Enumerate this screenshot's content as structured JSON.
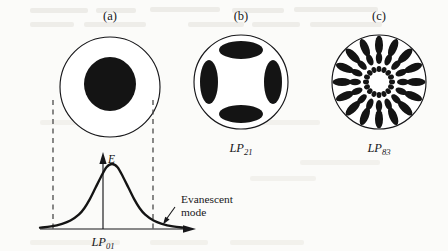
{
  "figure": {
    "caption_panels": [
      "(a)",
      "(b)",
      "(c)"
    ],
    "background_color": "#fbfbf9",
    "ink_color": "#17171a"
  },
  "panels": [
    {
      "id": "a",
      "label": "(a)",
      "mode_label": "LP",
      "mode_sub": "01",
      "mode_full": "LP01",
      "pattern": "single-central-lobe",
      "cladding_circle": {
        "cx": 110,
        "cy": 87,
        "r": 50
      },
      "lobes": [
        {
          "cx": 110,
          "cy": 84,
          "rx": 26,
          "ry": 27,
          "rot": 0
        }
      ]
    },
    {
      "id": "b",
      "label": "(b)",
      "mode_label": "LP",
      "mode_sub": "21",
      "mode_full": "LP21",
      "pattern": "four-lobe-cross",
      "cladding_circle": {
        "cx": 241,
        "cy": 82,
        "r": 47
      },
      "lobes": [
        {
          "cx": 241,
          "cy": 50,
          "rx": 22,
          "ry": 9,
          "rot": 0
        },
        {
          "cx": 241,
          "cy": 114,
          "rx": 22,
          "ry": 9,
          "rot": 0
        },
        {
          "cx": 209,
          "cy": 82,
          "rx": 9,
          "ry": 22,
          "rot": 0
        },
        {
          "cx": 273,
          "cy": 82,
          "rx": 9,
          "ry": 22,
          "rot": 0
        }
      ]
    },
    {
      "id": "c",
      "label": "(c)",
      "mode_label": "LP",
      "mode_sub": "83",
      "mode_full": "LP83",
      "pattern": "three-concentric-rings",
      "cladding_circle": {
        "cx": 379,
        "cy": 82,
        "r": 47
      },
      "rings": [
        {
          "name": "outer-ring",
          "count": 16,
          "radius": 37,
          "rx": 9.5,
          "ry": 4.0
        },
        {
          "name": "middle-ring",
          "count": 16,
          "radius": 24,
          "rx": 6.0,
          "ry": 3.2
        },
        {
          "name": "inner-ring",
          "count": 16,
          "radius": 13,
          "rx": 3.0,
          "ry": 2.4
        }
      ]
    }
  ],
  "plot": {
    "field_symbol": "E",
    "x_axis_label": "LP",
    "x_axis_sub": "01",
    "x_axis_full": "LP01",
    "annotation_line1": "Evanescent",
    "annotation_line2": "mode",
    "core_boundary_left_x": 53,
    "core_boundary_right_x": 153,
    "axis_baseline_y": 229,
    "peak_x": 103,
    "peak_y": 164,
    "curve_type": "gaussian-field-profile"
  },
  "chart_data": {
    "type": "line",
    "title": "",
    "xlabel": "LP01",
    "ylabel": "E",
    "annotations": [
      "Evanescent mode"
    ],
    "x": [
      -2.6,
      -2.2,
      -1.8,
      -1.5,
      -1.2,
      -1.0,
      -0.8,
      -0.6,
      -0.4,
      -0.2,
      0.0,
      0.2,
      0.4,
      0.6,
      0.8,
      1.0,
      1.2,
      1.5,
      1.8,
      2.2,
      2.6
    ],
    "y": [
      0.02,
      0.04,
      0.08,
      0.13,
      0.22,
      0.32,
      0.46,
      0.63,
      0.8,
      0.95,
      1.0,
      0.95,
      0.8,
      0.63,
      0.46,
      0.32,
      0.22,
      0.13,
      0.08,
      0.04,
      0.02
    ],
    "core_edges": [
      -1.0,
      1.0
    ],
    "grid": false,
    "legend": false
  },
  "bleedthrough": {
    "line1": "reverse-page bleed",
    "line2": "reverse-page bleed"
  }
}
